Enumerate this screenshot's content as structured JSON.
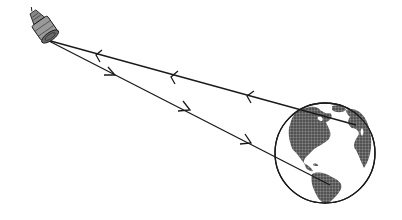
{
  "diagram": {
    "elements": [
      {
        "id": "satellite",
        "label": "Satellite"
      },
      {
        "id": "earth",
        "label": "Earth (Americas, Europe, Africa visible)"
      },
      {
        "id": "uplink",
        "label": "Signal path Earth to satellite",
        "direction": "toward satellite"
      },
      {
        "id": "downlink",
        "label": "Signal path satellite to Earth",
        "direction": "toward Earth"
      }
    ],
    "colors": {
      "ink": "#1a1a1a",
      "land": "#555555",
      "background": "#ffffff"
    }
  }
}
